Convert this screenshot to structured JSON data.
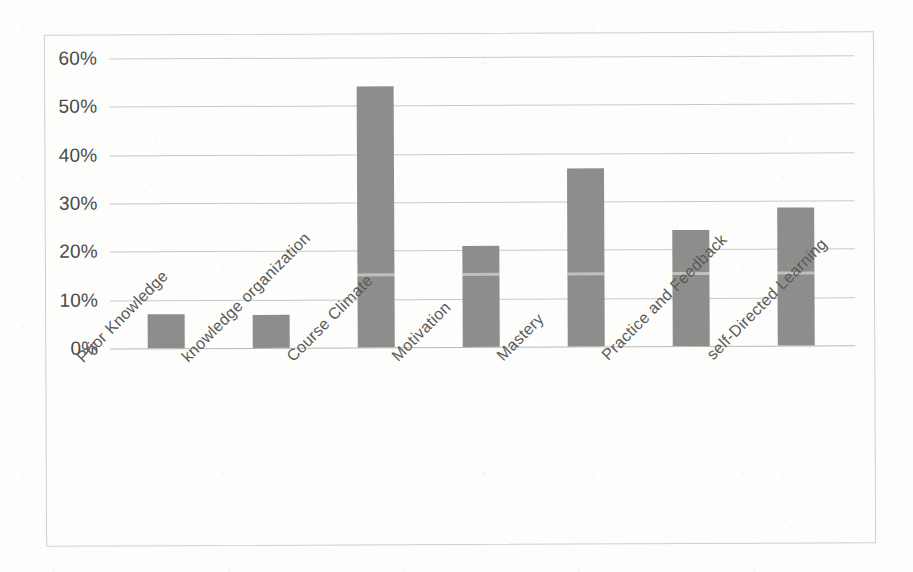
{
  "chart_data": {
    "type": "bar",
    "title": "",
    "subtitle": "",
    "xlabel": "",
    "ylabel": "",
    "categories": [
      "Prior Knowledge",
      "knowledge organization",
      "Course Climate",
      "Motivation",
      "Mastery",
      "Practice and Feedback",
      "self-Directed Learning"
    ],
    "values": [
      7,
      6.8,
      54,
      21,
      36.8,
      24,
      28.5
    ],
    "value_labels": [
      "7%",
      "7%",
      "54%",
      "21%",
      "37%",
      "24%",
      "29%"
    ],
    "ylim": [
      0,
      60
    ],
    "ytick_values": [
      0,
      10,
      20,
      30,
      40,
      50,
      60
    ],
    "ytick_labels": [
      "0%",
      "10%",
      "20%",
      "30%",
      "40%",
      "50%",
      "60%"
    ],
    "grid": true,
    "legend": false,
    "legend_position": "none",
    "series": [
      {
        "name": "Percent",
        "values": [
          7,
          6.8,
          54,
          21,
          36.8,
          24,
          28.5
        ]
      }
    ],
    "colors": {
      "bar": "#8d8d8b",
      "gridline": "#c9c9c7",
      "axis_text": "#4a4a4a",
      "category_text": "#5a5a58",
      "frame_border": "#cfcfcd",
      "background": "#fdfdfc"
    }
  }
}
